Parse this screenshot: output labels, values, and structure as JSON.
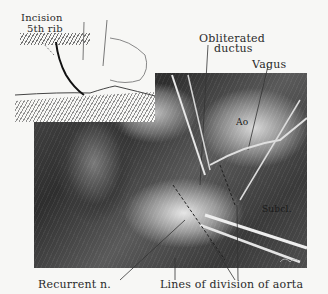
{
  "figure": {
    "inset": {
      "labels": {
        "incision": "Incision",
        "rib": "5th rib"
      }
    },
    "labels": {
      "obliterated_ductus_line1": "Obliterated",
      "obliterated_ductus_line2": "ductus",
      "vagus": "Vagus",
      "aorta_abbrev": "Ao",
      "subclavian_abbrev": "Subcl.",
      "recurrent_nerve": "Recurrent n.",
      "lines_of_division": "Lines of division of aorta"
    },
    "colors": {
      "background": "#f7f7f5",
      "ink": "#2a2a2a"
    }
  }
}
